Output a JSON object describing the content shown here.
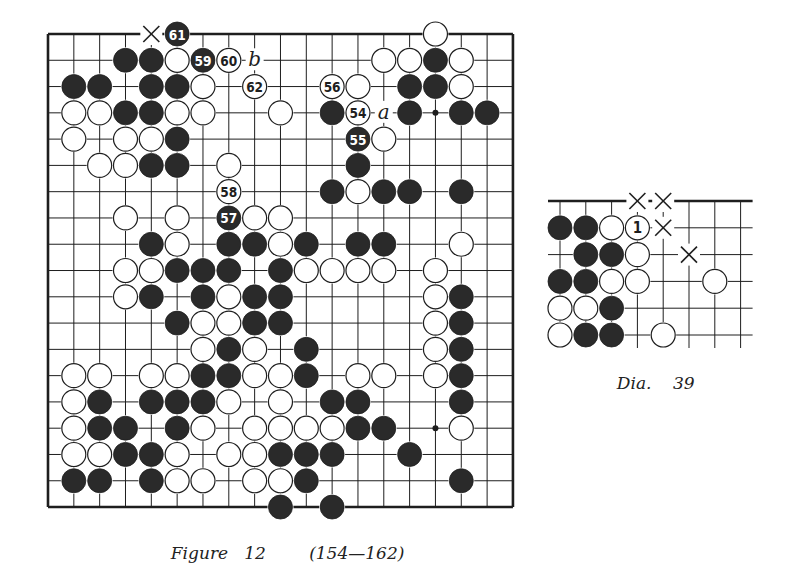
{
  "figure": {
    "caption_title": "Figure",
    "caption_number": "12",
    "caption_range": "(154—162)",
    "board": {
      "size": 19,
      "origin": [
        48,
        34
      ],
      "spacing": [
        25.83,
        26.28
      ],
      "edges": {
        "left": true,
        "right": true,
        "top": true,
        "bottom": true
      },
      "hoshi": [
        [
          15,
          3
        ],
        [
          15,
          15
        ]
      ],
      "stones": [
        {
          "c": 5,
          "r": 0,
          "color": "black",
          "label": "61"
        },
        {
          "c": 15,
          "r": 0,
          "color": "white"
        },
        {
          "c": 3,
          "r": 1,
          "color": "black"
        },
        {
          "c": 4,
          "r": 1,
          "color": "black"
        },
        {
          "c": 5,
          "r": 1,
          "color": "white"
        },
        {
          "c": 6,
          "r": 1,
          "color": "black",
          "label": "59"
        },
        {
          "c": 7,
          "r": 1,
          "color": "white",
          "label": "60"
        },
        {
          "c": 13,
          "r": 1,
          "color": "white"
        },
        {
          "c": 14,
          "r": 1,
          "color": "white"
        },
        {
          "c": 15,
          "r": 1,
          "color": "black"
        },
        {
          "c": 16,
          "r": 1,
          "color": "white"
        },
        {
          "c": 1,
          "r": 2,
          "color": "black"
        },
        {
          "c": 2,
          "r": 2,
          "color": "black"
        },
        {
          "c": 4,
          "r": 2,
          "color": "black"
        },
        {
          "c": 5,
          "r": 2,
          "color": "black"
        },
        {
          "c": 6,
          "r": 2,
          "color": "white"
        },
        {
          "c": 8,
          "r": 2,
          "color": "white",
          "label": "62"
        },
        {
          "c": 11,
          "r": 2,
          "color": "white",
          "label": "56"
        },
        {
          "c": 12,
          "r": 2,
          "color": "white"
        },
        {
          "c": 14,
          "r": 2,
          "color": "black"
        },
        {
          "c": 15,
          "r": 2,
          "color": "black"
        },
        {
          "c": 16,
          "r": 2,
          "color": "white"
        },
        {
          "c": 1,
          "r": 3,
          "color": "white"
        },
        {
          "c": 2,
          "r": 3,
          "color": "white"
        },
        {
          "c": 3,
          "r": 3,
          "color": "black"
        },
        {
          "c": 4,
          "r": 3,
          "color": "black"
        },
        {
          "c": 5,
          "r": 3,
          "color": "white"
        },
        {
          "c": 6,
          "r": 3,
          "color": "white"
        },
        {
          "c": 9,
          "r": 3,
          "color": "white"
        },
        {
          "c": 11,
          "r": 3,
          "color": "black"
        },
        {
          "c": 12,
          "r": 3,
          "color": "white",
          "label": "54"
        },
        {
          "c": 14,
          "r": 3,
          "color": "black"
        },
        {
          "c": 16,
          "r": 3,
          "color": "black"
        },
        {
          "c": 17,
          "r": 3,
          "color": "black"
        },
        {
          "c": 1,
          "r": 4,
          "color": "white"
        },
        {
          "c": 3,
          "r": 4,
          "color": "white"
        },
        {
          "c": 4,
          "r": 4,
          "color": "white"
        },
        {
          "c": 5,
          "r": 4,
          "color": "black"
        },
        {
          "c": 12,
          "r": 4,
          "color": "black",
          "label": "55"
        },
        {
          "c": 13,
          "r": 4,
          "color": "white"
        },
        {
          "c": 2,
          "r": 5,
          "color": "white"
        },
        {
          "c": 3,
          "r": 5,
          "color": "white"
        },
        {
          "c": 4,
          "r": 5,
          "color": "black"
        },
        {
          "c": 5,
          "r": 5,
          "color": "black"
        },
        {
          "c": 7,
          "r": 5,
          "color": "white"
        },
        {
          "c": 12,
          "r": 5,
          "color": "black"
        },
        {
          "c": 7,
          "r": 6,
          "color": "white",
          "label": "58"
        },
        {
          "c": 11,
          "r": 6,
          "color": "black"
        },
        {
          "c": 12,
          "r": 6,
          "color": "white"
        },
        {
          "c": 13,
          "r": 6,
          "color": "black"
        },
        {
          "c": 14,
          "r": 6,
          "color": "black"
        },
        {
          "c": 16,
          "r": 6,
          "color": "black"
        },
        {
          "c": 3,
          "r": 7,
          "color": "white"
        },
        {
          "c": 5,
          "r": 7,
          "color": "white"
        },
        {
          "c": 7,
          "r": 7,
          "color": "black",
          "label": "57"
        },
        {
          "c": 8,
          "r": 7,
          "color": "white"
        },
        {
          "c": 9,
          "r": 7,
          "color": "white"
        },
        {
          "c": 4,
          "r": 8,
          "color": "black"
        },
        {
          "c": 5,
          "r": 8,
          "color": "white"
        },
        {
          "c": 7,
          "r": 8,
          "color": "black"
        },
        {
          "c": 8,
          "r": 8,
          "color": "black"
        },
        {
          "c": 9,
          "r": 8,
          "color": "white"
        },
        {
          "c": 10,
          "r": 8,
          "color": "black"
        },
        {
          "c": 12,
          "r": 8,
          "color": "black"
        },
        {
          "c": 13,
          "r": 8,
          "color": "black"
        },
        {
          "c": 16,
          "r": 8,
          "color": "white"
        },
        {
          "c": 3,
          "r": 9,
          "color": "white"
        },
        {
          "c": 4,
          "r": 9,
          "color": "white"
        },
        {
          "c": 5,
          "r": 9,
          "color": "black"
        },
        {
          "c": 6,
          "r": 9,
          "color": "black"
        },
        {
          "c": 7,
          "r": 9,
          "color": "black"
        },
        {
          "c": 9,
          "r": 9,
          "color": "black"
        },
        {
          "c": 10,
          "r": 9,
          "color": "white"
        },
        {
          "c": 11,
          "r": 9,
          "color": "white"
        },
        {
          "c": 12,
          "r": 9,
          "color": "white"
        },
        {
          "c": 13,
          "r": 9,
          "color": "white"
        },
        {
          "c": 15,
          "r": 9,
          "color": "white"
        },
        {
          "c": 3,
          "r": 10,
          "color": "white"
        },
        {
          "c": 4,
          "r": 10,
          "color": "black"
        },
        {
          "c": 6,
          "r": 10,
          "color": "black"
        },
        {
          "c": 7,
          "r": 10,
          "color": "white"
        },
        {
          "c": 8,
          "r": 10,
          "color": "black"
        },
        {
          "c": 9,
          "r": 10,
          "color": "black"
        },
        {
          "c": 15,
          "r": 10,
          "color": "white"
        },
        {
          "c": 16,
          "r": 10,
          "color": "black"
        },
        {
          "c": 5,
          "r": 11,
          "color": "black"
        },
        {
          "c": 6,
          "r": 11,
          "color": "white"
        },
        {
          "c": 7,
          "r": 11,
          "color": "white"
        },
        {
          "c": 8,
          "r": 11,
          "color": "black"
        },
        {
          "c": 9,
          "r": 11,
          "color": "black"
        },
        {
          "c": 15,
          "r": 11,
          "color": "white"
        },
        {
          "c": 16,
          "r": 11,
          "color": "black"
        },
        {
          "c": 6,
          "r": 12,
          "color": "white"
        },
        {
          "c": 7,
          "r": 12,
          "color": "black"
        },
        {
          "c": 8,
          "r": 12,
          "color": "white"
        },
        {
          "c": 10,
          "r": 12,
          "color": "black"
        },
        {
          "c": 15,
          "r": 12,
          "color": "white"
        },
        {
          "c": 16,
          "r": 12,
          "color": "black"
        },
        {
          "c": 1,
          "r": 13,
          "color": "white"
        },
        {
          "c": 2,
          "r": 13,
          "color": "white"
        },
        {
          "c": 4,
          "r": 13,
          "color": "white"
        },
        {
          "c": 5,
          "r": 13,
          "color": "white"
        },
        {
          "c": 6,
          "r": 13,
          "color": "black"
        },
        {
          "c": 7,
          "r": 13,
          "color": "black"
        },
        {
          "c": 8,
          "r": 13,
          "color": "white"
        },
        {
          "c": 9,
          "r": 13,
          "color": "white"
        },
        {
          "c": 10,
          "r": 13,
          "color": "black"
        },
        {
          "c": 12,
          "r": 13,
          "color": "white"
        },
        {
          "c": 13,
          "r": 13,
          "color": "white"
        },
        {
          "c": 15,
          "r": 13,
          "color": "white"
        },
        {
          "c": 16,
          "r": 13,
          "color": "black"
        },
        {
          "c": 1,
          "r": 14,
          "color": "white"
        },
        {
          "c": 2,
          "r": 14,
          "color": "black"
        },
        {
          "c": 4,
          "r": 14,
          "color": "black"
        },
        {
          "c": 5,
          "r": 14,
          "color": "black"
        },
        {
          "c": 6,
          "r": 14,
          "color": "black"
        },
        {
          "c": 7,
          "r": 14,
          "color": "white"
        },
        {
          "c": 9,
          "r": 14,
          "color": "white"
        },
        {
          "c": 11,
          "r": 14,
          "color": "black"
        },
        {
          "c": 12,
          "r": 14,
          "color": "black"
        },
        {
          "c": 16,
          "r": 14,
          "color": "black"
        },
        {
          "c": 1,
          "r": 15,
          "color": "white"
        },
        {
          "c": 2,
          "r": 15,
          "color": "black"
        },
        {
          "c": 3,
          "r": 15,
          "color": "black"
        },
        {
          "c": 5,
          "r": 15,
          "color": "black"
        },
        {
          "c": 6,
          "r": 15,
          "color": "white"
        },
        {
          "c": 8,
          "r": 15,
          "color": "white"
        },
        {
          "c": 9,
          "r": 15,
          "color": "white"
        },
        {
          "c": 10,
          "r": 15,
          "color": "white"
        },
        {
          "c": 11,
          "r": 15,
          "color": "white"
        },
        {
          "c": 12,
          "r": 15,
          "color": "black"
        },
        {
          "c": 13,
          "r": 15,
          "color": "black"
        },
        {
          "c": 16,
          "r": 15,
          "color": "white"
        },
        {
          "c": 1,
          "r": 16,
          "color": "white"
        },
        {
          "c": 2,
          "r": 16,
          "color": "white"
        },
        {
          "c": 3,
          "r": 16,
          "color": "black"
        },
        {
          "c": 4,
          "r": 16,
          "color": "black"
        },
        {
          "c": 5,
          "r": 16,
          "color": "white"
        },
        {
          "c": 7,
          "r": 16,
          "color": "white"
        },
        {
          "c": 8,
          "r": 16,
          "color": "white"
        },
        {
          "c": 9,
          "r": 16,
          "color": "black"
        },
        {
          "c": 10,
          "r": 16,
          "color": "black"
        },
        {
          "c": 11,
          "r": 16,
          "color": "black"
        },
        {
          "c": 14,
          "r": 16,
          "color": "black"
        },
        {
          "c": 1,
          "r": 17,
          "color": "black"
        },
        {
          "c": 2,
          "r": 17,
          "color": "black"
        },
        {
          "c": 4,
          "r": 17,
          "color": "black"
        },
        {
          "c": 5,
          "r": 17,
          "color": "white"
        },
        {
          "c": 6,
          "r": 17,
          "color": "white"
        },
        {
          "c": 8,
          "r": 17,
          "color": "white"
        },
        {
          "c": 9,
          "r": 17,
          "color": "white"
        },
        {
          "c": 10,
          "r": 17,
          "color": "black"
        },
        {
          "c": 16,
          "r": 17,
          "color": "black"
        },
        {
          "c": 9,
          "r": 18,
          "color": "black"
        },
        {
          "c": 11,
          "r": 18,
          "color": "black"
        }
      ],
      "marks": [
        {
          "c": 4,
          "r": 0,
          "type": "cross"
        },
        {
          "c": 8,
          "r": 1,
          "type": "letter",
          "text": "b"
        },
        {
          "c": 13,
          "r": 3,
          "type": "letter",
          "text": "a"
        }
      ]
    }
  },
  "diagram": {
    "caption_title": "Dia.",
    "caption_number": "39",
    "board": {
      "cols": 8,
      "rows": 6,
      "origin": [
        560,
        201
      ],
      "spacing": [
        25.8,
        26.8
      ],
      "stones": [
        {
          "c": 0,
          "r": 1,
          "color": "black"
        },
        {
          "c": 1,
          "r": 1,
          "color": "black"
        },
        {
          "c": 2,
          "r": 1,
          "color": "white"
        },
        {
          "c": 3,
          "r": 1,
          "color": "white",
          "label": "1"
        },
        {
          "c": 1,
          "r": 2,
          "color": "black"
        },
        {
          "c": 2,
          "r": 2,
          "color": "black"
        },
        {
          "c": 3,
          "r": 2,
          "color": "white"
        },
        {
          "c": 0,
          "r": 3,
          "color": "black"
        },
        {
          "c": 1,
          "r": 3,
          "color": "black"
        },
        {
          "c": 2,
          "r": 3,
          "color": "white"
        },
        {
          "c": 3,
          "r": 3,
          "color": "white"
        },
        {
          "c": 6,
          "r": 3,
          "color": "white"
        },
        {
          "c": 0,
          "r": 4,
          "color": "white"
        },
        {
          "c": 1,
          "r": 4,
          "color": "white"
        },
        {
          "c": 2,
          "r": 4,
          "color": "black"
        },
        {
          "c": 0,
          "r": 5,
          "color": "white"
        },
        {
          "c": 1,
          "r": 5,
          "color": "black"
        },
        {
          "c": 2,
          "r": 5,
          "color": "black"
        },
        {
          "c": 4,
          "r": 5,
          "color": "white"
        }
      ],
      "marks": [
        {
          "c": 3,
          "r": 0,
          "type": "cross"
        },
        {
          "c": 4,
          "r": 0,
          "type": "cross"
        },
        {
          "c": 4,
          "r": 1,
          "type": "cross"
        },
        {
          "c": 5,
          "r": 2,
          "type": "cross"
        }
      ]
    }
  },
  "colors": {
    "ink": "#1e1e1e",
    "black_stone": "#2a2a2a",
    "white_stone": "#ffffff",
    "paper": "#ffffff"
  }
}
